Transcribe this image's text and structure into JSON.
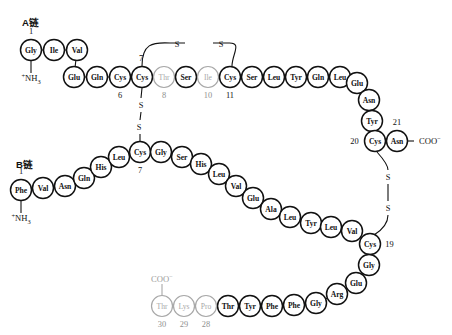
{
  "figure": {
    "chain_a_label": "A链",
    "chain_b_label": "B链",
    "n_terminus_text": "NH",
    "n_terminus_sub": "3",
    "n_terminus_sup": "+",
    "c_terminus_text": "COO",
    "c_terminus_sup": "−",
    "sulfur_symbol": "S",
    "colors": {
      "ink": "#111111",
      "muted": "#a8a8a8",
      "background": "#ffffff"
    }
  },
  "chain_a": {
    "label": "A链",
    "start_index": "1",
    "residues": [
      {
        "name": "Gly",
        "index": "1",
        "x": 31,
        "y": 50,
        "muted": false,
        "show_index": true,
        "index_pos": "top"
      },
      {
        "name": "Ile",
        "index": "2",
        "x": 54,
        "y": 50,
        "muted": false,
        "show_index": false,
        "index_pos": "top"
      },
      {
        "name": "Val",
        "index": "3",
        "x": 77,
        "y": 50,
        "muted": false,
        "show_index": false,
        "index_pos": "top"
      },
      {
        "name": "Glu",
        "index": "4",
        "x": 74,
        "y": 77,
        "muted": false,
        "show_index": false,
        "index_pos": "bottom"
      },
      {
        "name": "Gln",
        "index": "5",
        "x": 97,
        "y": 77,
        "muted": false,
        "show_index": false,
        "index_pos": "bottom"
      },
      {
        "name": "Cys",
        "index": "6",
        "x": 120,
        "y": 77,
        "muted": false,
        "show_index": true,
        "index_pos": "bottom"
      },
      {
        "name": "Cys",
        "index": "7",
        "x": 142,
        "y": 77,
        "muted": false,
        "show_index": true,
        "index_pos": "above-left"
      },
      {
        "name": "Thr",
        "index": "8",
        "x": 164,
        "y": 77,
        "muted": true,
        "show_index": true,
        "index_pos": "bottom"
      },
      {
        "name": "Ser",
        "index": "9",
        "x": 186,
        "y": 77,
        "muted": false,
        "show_index": false,
        "index_pos": "bottom"
      },
      {
        "name": "Ile",
        "index": "10",
        "x": 208,
        "y": 77,
        "muted": true,
        "show_index": true,
        "index_pos": "bottom"
      },
      {
        "name": "Cys",
        "index": "11",
        "x": 230,
        "y": 77,
        "muted": false,
        "show_index": true,
        "index_pos": "bottom"
      },
      {
        "name": "Ser",
        "index": "12",
        "x": 252,
        "y": 77,
        "muted": false,
        "show_index": false,
        "index_pos": "bottom"
      },
      {
        "name": "Leu",
        "index": "13",
        "x": 274,
        "y": 77,
        "muted": false,
        "show_index": false,
        "index_pos": "bottom"
      },
      {
        "name": "Tyr",
        "index": "14",
        "x": 296,
        "y": 77,
        "muted": false,
        "show_index": false,
        "index_pos": "bottom"
      },
      {
        "name": "Gln",
        "index": "15",
        "x": 318,
        "y": 77,
        "muted": false,
        "show_index": false,
        "index_pos": "bottom"
      },
      {
        "name": "Leu",
        "index": "16",
        "x": 340,
        "y": 77,
        "muted": false,
        "show_index": false,
        "index_pos": "bottom"
      },
      {
        "name": "Glu",
        "index": "17",
        "x": 357,
        "y": 83,
        "muted": false,
        "show_index": false,
        "index_pos": "bottom"
      },
      {
        "name": "Asn",
        "index": "18",
        "x": 369,
        "y": 100,
        "muted": false,
        "show_index": false,
        "index_pos": "bottom"
      },
      {
        "name": "Tyr",
        "index": "19",
        "x": 372,
        "y": 121,
        "muted": false,
        "show_index": false,
        "index_pos": "bottom"
      },
      {
        "name": "Cys",
        "index": "20",
        "x": 375,
        "y": 141,
        "muted": false,
        "show_index": true,
        "index_pos": "left"
      },
      {
        "name": "Asn",
        "index": "21",
        "x": 397,
        "y": 141,
        "muted": false,
        "show_index": true,
        "index_pos": "top"
      }
    ],
    "n_terminus": {
      "x": 31,
      "y": 78,
      "label": "NH",
      "sub": "3",
      "sup": "+"
    },
    "c_terminus": {
      "x": 419,
      "y": 141,
      "label": "COO",
      "sup": "−"
    }
  },
  "chain_b": {
    "label": "B链",
    "start_index": "1",
    "residues": [
      {
        "name": "Phe",
        "index": "1",
        "x": 21,
        "y": 190,
        "muted": false,
        "show_index": true,
        "index_pos": "top"
      },
      {
        "name": "Val",
        "index": "2",
        "x": 43,
        "y": 188,
        "muted": false,
        "show_index": false,
        "index_pos": "top"
      },
      {
        "name": "Asn",
        "index": "3",
        "x": 65,
        "y": 186,
        "muted": false,
        "show_index": false,
        "index_pos": "top"
      },
      {
        "name": "Gln",
        "index": "4",
        "x": 84,
        "y": 178,
        "muted": false,
        "show_index": false,
        "index_pos": "top"
      },
      {
        "name": "His",
        "index": "5",
        "x": 101,
        "y": 167,
        "muted": false,
        "show_index": false,
        "index_pos": "top"
      },
      {
        "name": "Leu",
        "index": "6",
        "x": 119,
        "y": 157,
        "muted": false,
        "show_index": false,
        "index_pos": "top"
      },
      {
        "name": "Cys",
        "index": "7",
        "x": 140,
        "y": 152,
        "muted": false,
        "show_index": true,
        "index_pos": "bottom"
      },
      {
        "name": "Gly",
        "index": "8",
        "x": 161,
        "y": 152,
        "muted": false,
        "show_index": false,
        "index_pos": "bottom"
      },
      {
        "name": "Ser",
        "index": "9",
        "x": 182,
        "y": 157,
        "muted": false,
        "show_index": false,
        "index_pos": "bottom"
      },
      {
        "name": "His",
        "index": "10",
        "x": 201,
        "y": 164,
        "muted": false,
        "show_index": false,
        "index_pos": "bottom"
      },
      {
        "name": "Leu",
        "index": "11",
        "x": 219,
        "y": 174,
        "muted": false,
        "show_index": false,
        "index_pos": "bottom"
      },
      {
        "name": "Val",
        "index": "12",
        "x": 236,
        "y": 186,
        "muted": false,
        "show_index": false,
        "index_pos": "bottom"
      },
      {
        "name": "Glu",
        "index": "13",
        "x": 253,
        "y": 198,
        "muted": false,
        "show_index": false,
        "index_pos": "bottom"
      },
      {
        "name": "Ala",
        "index": "14",
        "x": 271,
        "y": 209,
        "muted": false,
        "show_index": false,
        "index_pos": "bottom"
      },
      {
        "name": "Leu",
        "index": "15",
        "x": 290,
        "y": 217,
        "muted": false,
        "show_index": false,
        "index_pos": "bottom"
      },
      {
        "name": "Tyr",
        "index": "16",
        "x": 311,
        "y": 223,
        "muted": false,
        "show_index": false,
        "index_pos": "bottom"
      },
      {
        "name": "Leu",
        "index": "17",
        "x": 331,
        "y": 227,
        "muted": false,
        "show_index": false,
        "index_pos": "bottom"
      },
      {
        "name": "Val",
        "index": "18",
        "x": 352,
        "y": 231,
        "muted": false,
        "show_index": false,
        "index_pos": "bottom"
      },
      {
        "name": "Cys",
        "index": "19",
        "x": 370,
        "y": 244,
        "muted": false,
        "show_index": true,
        "index_pos": "right"
      },
      {
        "name": "Gly",
        "index": "20",
        "x": 369,
        "y": 265,
        "muted": false,
        "show_index": false,
        "index_pos": "bottom"
      },
      {
        "name": "Glu",
        "index": "21",
        "x": 356,
        "y": 283,
        "muted": false,
        "show_index": false,
        "index_pos": "bottom"
      },
      {
        "name": "Arg",
        "index": "22",
        "x": 337,
        "y": 294,
        "muted": false,
        "show_index": false,
        "index_pos": "bottom"
      },
      {
        "name": "Gly",
        "index": "23",
        "x": 316,
        "y": 303,
        "muted": false,
        "show_index": false,
        "index_pos": "bottom"
      },
      {
        "name": "Phe",
        "index": "24",
        "x": 294,
        "y": 305,
        "muted": false,
        "show_index": false,
        "index_pos": "bottom"
      },
      {
        "name": "Phe",
        "index": "25",
        "x": 272,
        "y": 306,
        "muted": false,
        "show_index": false,
        "index_pos": "bottom"
      },
      {
        "name": "Tyr",
        "index": "26",
        "x": 250,
        "y": 306,
        "muted": false,
        "show_index": false,
        "index_pos": "bottom"
      },
      {
        "name": "Thr",
        "index": "27",
        "x": 228,
        "y": 306,
        "muted": false,
        "show_index": false,
        "index_pos": "bottom"
      },
      {
        "name": "Pro",
        "index": "28",
        "x": 206,
        "y": 306,
        "muted": true,
        "show_index": true,
        "index_pos": "bottom"
      },
      {
        "name": "Lys",
        "index": "29",
        "x": 184,
        "y": 306,
        "muted": true,
        "show_index": true,
        "index_pos": "bottom"
      },
      {
        "name": "Thr",
        "index": "30",
        "x": 162,
        "y": 306,
        "muted": true,
        "show_index": true,
        "index_pos": "bottom"
      }
    ],
    "n_terminus": {
      "x": 21,
      "y": 218,
      "label": "NH",
      "sub": "3",
      "sup": "+"
    },
    "c_terminus": {
      "x": 162,
      "y": 279,
      "label": "COO",
      "sup": "−"
    }
  },
  "disulfide_bonds": [
    {
      "id": "A6-A11",
      "kind": "intrachain-a",
      "from": "Cys A7",
      "to": "Cys A11",
      "sulfur_positions": [
        {
          "x": 177,
          "y": 44
        },
        {
          "x": 221,
          "y": 44
        }
      ],
      "path": "M 142 66 C 142 44, 152 42, 170 43 L 185 43 M 213 43 L 228 43 C 243 42, 232 54, 232 66"
    },
    {
      "id": "A7-B7",
      "kind": "interchain-left",
      "from": "Cys A7",
      "to": "Cys B7",
      "sulfur_positions": [
        {
          "x": 141,
          "y": 105
        },
        {
          "x": 139,
          "y": 127
        }
      ],
      "path": "M 142 88 L 141 98 M 141 112 L 140 120 M 140 134 L 140 142"
    },
    {
      "id": "A20-B19",
      "kind": "interchain-right",
      "from": "Cys A20",
      "to": "Cys B19",
      "sulfur_positions": [
        {
          "x": 388,
          "y": 177
        },
        {
          "x": 388,
          "y": 208
        }
      ],
      "path": "M 377 152 C 386 162, 388 166, 388 170 M 388 184 L 388 201 M 388 215 C 388 224, 382 230, 374 235"
    }
  ],
  "legend": {
    "muted_note": "species-variable residues shown in grey"
  }
}
